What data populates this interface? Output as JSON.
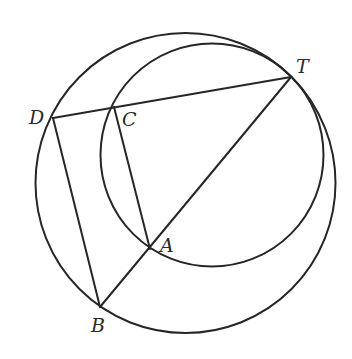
{
  "diagram": {
    "type": "geometry",
    "stroke_color": "#262626",
    "background": "#ffffff",
    "circles": [
      {
        "name": "large-circle",
        "cx": 185.5,
        "cy": 183,
        "r": 150
      },
      {
        "name": "small-circle",
        "cx": 212,
        "cy": 155,
        "r": 111.5
      }
    ],
    "points": {
      "T": {
        "x": 291,
        "y": 77
      },
      "D": {
        "x": 53,
        "y": 118
      },
      "C": {
        "x": 114,
        "y": 107
      },
      "A": {
        "x": 150,
        "y": 249
      },
      "B": {
        "x": 100,
        "y": 307
      }
    },
    "segments": [
      [
        "D",
        "T"
      ],
      [
        "D",
        "B"
      ],
      [
        "C",
        "A"
      ],
      [
        "B",
        "T"
      ]
    ],
    "labels": {
      "T": {
        "text": "T",
        "x": 296,
        "y": 73
      },
      "D": {
        "text": "D",
        "x": 29,
        "y": 124
      },
      "C": {
        "text": "C",
        "x": 122,
        "y": 126
      },
      "A": {
        "text": "A",
        "x": 160,
        "y": 252
      },
      "B": {
        "text": "B",
        "x": 91,
        "y": 332
      }
    }
  }
}
